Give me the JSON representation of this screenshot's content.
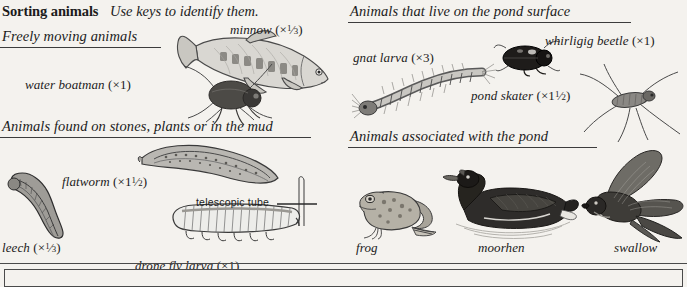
{
  "page": {
    "background_color": "#f4f2ee",
    "ink_color": "#1b1b1b",
    "rule_color": "#4a4a4a"
  },
  "header": {
    "title": "Sorting animals",
    "subtitle": "Use keys to identify them."
  },
  "sections": [
    {
      "id": "freely-moving",
      "heading": "Freely moving animals",
      "figures": [
        {
          "id": "minnow",
          "label": "minnow",
          "magnification": "×⅓",
          "caption": "minnow (×⅓)"
        },
        {
          "id": "water-boatman",
          "label": "water boatman",
          "magnification": "×1",
          "caption": "water boatman (×1)"
        }
      ]
    },
    {
      "id": "stones-plants-mud",
      "heading": "Animals found on stones, plants or in the mud",
      "figures": [
        {
          "id": "flatworm",
          "label": "flatworm",
          "magnification": "×1½",
          "caption": "flatworm (×1½)"
        },
        {
          "id": "leech",
          "label": "leech",
          "magnification": "×⅓",
          "caption": "leech (×⅓)"
        },
        {
          "id": "drone-fly-larva",
          "label": "drone fly larva",
          "magnification": "×1",
          "caption": "drone fly larva (×1)",
          "annotation": "telescopic tube"
        }
      ]
    },
    {
      "id": "pond-surface",
      "heading": "Animals that live on the pond surface",
      "figures": [
        {
          "id": "gnat-larva",
          "label": "gnat larva",
          "magnification": "×3",
          "caption": "gnat larva (×3)"
        },
        {
          "id": "whirligig-beetle",
          "label": "whirligig beetle",
          "magnification": "×1",
          "caption": "whirligig beetle (×1)"
        },
        {
          "id": "pond-skater",
          "label": "pond skater",
          "magnification": "×1½",
          "caption": "pond skater (×1½)"
        }
      ]
    },
    {
      "id": "associated-with-pond",
      "heading": "Animals associated with the pond",
      "figures": [
        {
          "id": "frog",
          "label": "frog",
          "magnification": "",
          "caption": "frog"
        },
        {
          "id": "moorhen",
          "label": "moorhen",
          "magnification": "",
          "caption": "moorhen"
        },
        {
          "id": "swallow",
          "label": "swallow",
          "magnification": "",
          "caption": "swallow"
        }
      ]
    }
  ],
  "labels": {
    "minnow": "minnow",
    "water_boatman": "water boatman",
    "flatworm": "flatworm",
    "leech": "leech",
    "drone_fly_larva": "drone fly larva",
    "telescopic_tube": "telescopic tube",
    "gnat_larva": "gnat larva",
    "whirligig_beetle": "whirligig beetle",
    "pond_skater": "pond skater",
    "frog": "frog",
    "moorhen": "moorhen",
    "swallow": "swallow"
  },
  "magnifications": {
    "minnow": "(×⅓)",
    "water_boatman": "(×1)",
    "flatworm": "(×1½)",
    "leech": "(×⅓)",
    "drone_fly_larva": "(×1)",
    "gnat_larva": "(×3)",
    "whirligig_beetle": "(×1)",
    "pond_skater": "(×1½)"
  }
}
